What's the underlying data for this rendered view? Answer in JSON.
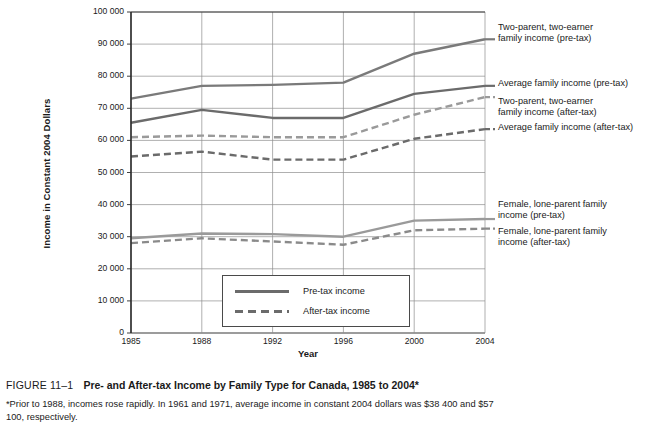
{
  "chart_data": {
    "type": "line",
    "title": "Pre- and After-tax Income by Family Type for Canada, 1985 to 2004*",
    "xlabel": "Year",
    "ylabel": "Income in Constant 2004 Dollars",
    "x": [
      1985,
      1988,
      1992,
      1996,
      2000,
      2004
    ],
    "xticklabels": [
      "1985",
      "1988",
      "1992",
      "1996",
      "2000",
      "2004"
    ],
    "yticklabels": [
      "0",
      "10 000",
      "20 000",
      "30 000",
      "40 000",
      "50 000",
      "60 000",
      "70 000",
      "80 000",
      "90 000",
      "100 000"
    ],
    "ytickvalues": [
      0,
      10000,
      20000,
      30000,
      40000,
      50000,
      60000,
      70000,
      80000,
      90000,
      100000
    ],
    "ylim": [
      0,
      100000
    ],
    "xlim": [
      1985,
      2004
    ],
    "grid": "both",
    "legend_position": "inside-bottom-center",
    "series": [
      {
        "name": "Two-parent, two-earner family income (pre-tax)",
        "style": "solid",
        "color": "#7a7a7a",
        "values": [
          73000,
          77000,
          77300,
          78000,
          87000,
          91500
        ],
        "label_lines": "Two-parent, two-earner\nfamily income (pre-tax)"
      },
      {
        "name": "Average family income (pre-tax)",
        "style": "solid",
        "color": "#6b6b6b",
        "values": [
          65500,
          69500,
          67000,
          67000,
          74500,
          77000
        ],
        "label_lines": "Average family income (pre-tax)"
      },
      {
        "name": "Two-parent, two-earner family income (after-tax)",
        "style": "dashed",
        "color": "#9a9a9a",
        "values": [
          61000,
          61500,
          61000,
          61000,
          68000,
          73500
        ],
        "label_lines": "Two-parent, two-earner\nfamily income (after-tax)"
      },
      {
        "name": "Average family income (after-tax)",
        "style": "dashed",
        "color": "#6b6b6b",
        "values": [
          55000,
          56500,
          54000,
          54000,
          60500,
          63500
        ],
        "label_lines": "Average family income (after-tax)"
      },
      {
        "name": "Female, lone-parent family income (pre-tax)",
        "style": "solid",
        "color": "#9a9a9a",
        "values": [
          29500,
          31000,
          30800,
          30000,
          35000,
          35500
        ],
        "label_lines": "Female, lone-parent family\nincome (pre-tax)"
      },
      {
        "name": "Female, lone-parent family income (after-tax)",
        "style": "dashed",
        "color": "#8a8a8a",
        "values": [
          28000,
          29500,
          28500,
          27500,
          32000,
          32500
        ],
        "label_lines": "Female, lone-parent family\nincome (after-tax)"
      }
    ],
    "legend": [
      {
        "label": "Pre-tax income",
        "style": "solid"
      },
      {
        "label": "After-tax income",
        "style": "dashed"
      }
    ]
  },
  "caption": {
    "figure_number": "FIGURE 11–1",
    "title": "Pre- and After-tax Income by Family Type for Canada, 1985 to 2004*",
    "note": "*Prior to 1988, incomes rose rapidly. In 1961 and 1971, average income in constant 2004 dollars was $38 400 and $57 100, respectively."
  }
}
